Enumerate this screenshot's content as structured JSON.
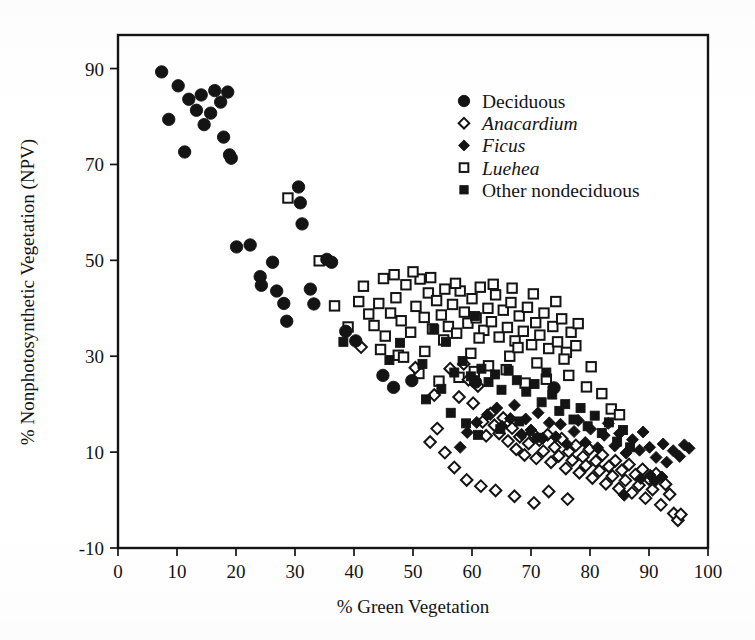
{
  "figure": {
    "kind": "scatter-plot",
    "background_color": "#ffffff",
    "ink_color": "#141414"
  },
  "axes": {
    "x": {
      "title": "% Green Vegetation",
      "min": 0,
      "max": 100,
      "ticks": [
        0,
        10,
        20,
        30,
        40,
        50,
        60,
        70,
        80,
        90,
        100
      ],
      "tick_labels": [
        "0",
        "10",
        "20",
        "30",
        "40",
        "50",
        "60",
        "70",
        "80",
        "90",
        "100"
      ]
    },
    "y": {
      "title": "% Nonphotosynthetic Vegetation (NPV)",
      "min": -10,
      "max": 97,
      "ticks": [
        -10,
        10,
        30,
        50,
        70,
        90
      ],
      "tick_labels": [
        "-10",
        "10",
        "30",
        "50",
        "70",
        "90"
      ]
    }
  },
  "legend": {
    "position": "top-right",
    "entries": [
      {
        "label": "Deciduous",
        "marker": "filled-circle",
        "italic": false
      },
      {
        "label": "Anacardium",
        "marker": "open-diamond",
        "italic": true
      },
      {
        "label": "Ficus",
        "marker": "filled-diamond",
        "italic": true
      },
      {
        "label": "Luehea",
        "marker": "open-square",
        "italic": true
      },
      {
        "label": "Other nondeciduous",
        "marker": "filled-square",
        "italic": false
      }
    ]
  },
  "chart_data": {
    "type": "scatter",
    "title": "",
    "xlabel": "% Green Vegetation",
    "ylabel": "% Nonphotosynthetic Vegetation (NPV)",
    "xlim": [
      0,
      100
    ],
    "ylim": [
      -10,
      97
    ],
    "grid": false,
    "legend_position": "top-right",
    "series": [
      {
        "name": "Deciduous",
        "marker": "filled-circle",
        "points": [
          [
            7.4,
            89.3
          ],
          [
            8.6,
            79.4
          ],
          [
            10.2,
            86.4
          ],
          [
            11.3,
            72.6
          ],
          [
            12.0,
            83.6
          ],
          [
            13.3,
            81.3
          ],
          [
            14.1,
            84.5
          ],
          [
            14.6,
            78.3
          ],
          [
            15.7,
            80.7
          ],
          [
            16.4,
            85.4
          ],
          [
            17.4,
            83.0
          ],
          [
            17.9,
            75.7
          ],
          [
            18.6,
            85.1
          ],
          [
            18.9,
            72.0
          ],
          [
            19.2,
            71.3
          ],
          [
            20.1,
            52.8
          ],
          [
            22.4,
            53.2
          ],
          [
            24.1,
            46.6
          ],
          [
            24.3,
            44.8
          ],
          [
            26.2,
            49.6
          ],
          [
            26.9,
            43.6
          ],
          [
            28.1,
            41.0
          ],
          [
            28.6,
            37.3
          ],
          [
            30.6,
            65.3
          ],
          [
            30.9,
            62.0
          ],
          [
            31.2,
            57.6
          ],
          [
            32.6,
            44.0
          ],
          [
            33.2,
            40.9
          ],
          [
            35.4,
            50.2
          ],
          [
            36.2,
            49.6
          ],
          [
            38.6,
            35.2
          ],
          [
            40.3,
            33.2
          ],
          [
            44.9,
            26.0
          ],
          [
            46.7,
            23.5
          ],
          [
            49.8,
            24.9
          ],
          [
            60.6,
            24.6
          ],
          [
            73.9,
            23.4
          ]
        ]
      },
      {
        "name": "Anacardium",
        "marker": "open-diamond",
        "points": [
          [
            41.2,
            31.9
          ],
          [
            50.4,
            27.6
          ],
          [
            53.6,
            21.9
          ],
          [
            54.1,
            14.9
          ],
          [
            56.3,
            27.4
          ],
          [
            57.8,
            21.5
          ],
          [
            58.6,
            28.4
          ],
          [
            59.4,
            25.1
          ],
          [
            60.2,
            20.2
          ],
          [
            61.0,
            23.8
          ],
          [
            61.8,
            16.3
          ],
          [
            62.4,
            13.4
          ],
          [
            63.1,
            18.0
          ],
          [
            63.8,
            15.6
          ],
          [
            64.6,
            13.9
          ],
          [
            65.3,
            17.1
          ],
          [
            66.1,
            12.3
          ],
          [
            66.8,
            15.0
          ],
          [
            67.5,
            10.6
          ],
          [
            68.1,
            13.2
          ],
          [
            68.9,
            9.4
          ],
          [
            69.6,
            11.8
          ],
          [
            70.2,
            14.0
          ],
          [
            70.9,
            8.7
          ],
          [
            71.4,
            12.5
          ],
          [
            72.1,
            10.2
          ],
          [
            72.8,
            13.6
          ],
          [
            73.4,
            7.9
          ],
          [
            74.0,
            11.0
          ],
          [
            74.7,
            9.2
          ],
          [
            75.2,
            12.8
          ],
          [
            75.9,
            6.6
          ],
          [
            76.4,
            10.1
          ],
          [
            77.0,
            8.3
          ],
          [
            77.6,
            11.4
          ],
          [
            78.2,
            5.7
          ],
          [
            78.8,
            9.0
          ],
          [
            79.3,
            7.2
          ],
          [
            79.9,
            10.6
          ],
          [
            80.4,
            4.6
          ],
          [
            81.0,
            8.1
          ],
          [
            81.6,
            6.1
          ],
          [
            82.1,
            9.4
          ],
          [
            82.7,
            3.4
          ],
          [
            83.2,
            7.0
          ],
          [
            83.8,
            5.0
          ],
          [
            84.3,
            8.2
          ],
          [
            84.9,
            2.4
          ],
          [
            85.4,
            6.2
          ],
          [
            86.0,
            4.1
          ],
          [
            86.6,
            7.4
          ],
          [
            87.1,
            1.5
          ],
          [
            87.7,
            5.3
          ],
          [
            88.3,
            3.1
          ],
          [
            88.9,
            6.4
          ],
          [
            89.4,
            0.4
          ],
          [
            90.0,
            4.4
          ],
          [
            90.6,
            2.2
          ],
          [
            91.2,
            5.5
          ],
          [
            92.0,
            -1.0
          ],
          [
            92.8,
            3.3
          ],
          [
            93.5,
            1.2
          ],
          [
            94.2,
            -2.8
          ],
          [
            94.9,
            -4.2
          ],
          [
            95.4,
            -3.0
          ],
          [
            64.0,
            2.0
          ],
          [
            67.2,
            0.8
          ],
          [
            70.5,
            -0.6
          ],
          [
            73.0,
            1.8
          ],
          [
            76.2,
            0.2
          ],
          [
            57.0,
            6.8
          ],
          [
            59.1,
            4.2
          ],
          [
            61.5,
            2.9
          ],
          [
            55.4,
            9.9
          ],
          [
            52.9,
            12.1
          ]
        ]
      },
      {
        "name": "Ficus",
        "marker": "filled-diamond",
        "points": [
          [
            62.6,
            17.8
          ],
          [
            64.2,
            19.2
          ],
          [
            65.1,
            15.4
          ],
          [
            66.5,
            17.0
          ],
          [
            67.2,
            19.8
          ],
          [
            68.4,
            13.7
          ],
          [
            69.1,
            16.9
          ],
          [
            70.0,
            14.6
          ],
          [
            71.2,
            18.2
          ],
          [
            72.0,
            12.9
          ],
          [
            73.1,
            16.1
          ],
          [
            74.2,
            13.2
          ],
          [
            75.0,
            15.8
          ],
          [
            76.1,
            11.6
          ],
          [
            77.3,
            14.3
          ],
          [
            78.0,
            16.6
          ],
          [
            79.2,
            12.0
          ],
          [
            80.1,
            14.8
          ],
          [
            81.3,
            10.9
          ],
          [
            82.4,
            13.5
          ],
          [
            83.1,
            16.0
          ],
          [
            84.2,
            11.3
          ],
          [
            85.0,
            13.9
          ],
          [
            86.1,
            9.8
          ],
          [
            87.2,
            12.6
          ],
          [
            88.4,
            10.4
          ],
          [
            89.0,
            14.2
          ],
          [
            90.1,
            11.0
          ],
          [
            91.2,
            8.9
          ],
          [
            92.4,
            11.7
          ],
          [
            93.0,
            7.9
          ],
          [
            94.1,
            10.3
          ],
          [
            95.2,
            9.1
          ],
          [
            96.0,
            11.5
          ],
          [
            96.8,
            10.8
          ],
          [
            88.6,
            4.5
          ],
          [
            90.2,
            5.2
          ],
          [
            91.0,
            3.9
          ],
          [
            92.2,
            4.8
          ],
          [
            85.8,
            1.0
          ],
          [
            60.8,
            16.2
          ],
          [
            59.2,
            14.1
          ],
          [
            58.0,
            11.0
          ]
        ]
      },
      {
        "name": "Luehea",
        "marker": "open-square",
        "points": [
          [
            28.8,
            63.0
          ],
          [
            34.1,
            49.9
          ],
          [
            36.7,
            40.5
          ],
          [
            39.0,
            36.1
          ],
          [
            40.8,
            41.4
          ],
          [
            41.6,
            44.6
          ],
          [
            42.5,
            38.8
          ],
          [
            43.4,
            36.4
          ],
          [
            44.2,
            41.0
          ],
          [
            45.3,
            34.2
          ],
          [
            46.2,
            39.0
          ],
          [
            47.1,
            42.2
          ],
          [
            48.0,
            37.4
          ],
          [
            48.8,
            44.9
          ],
          [
            49.6,
            35.0
          ],
          [
            50.5,
            40.4
          ],
          [
            51.2,
            46.1
          ],
          [
            51.9,
            38.1
          ],
          [
            52.6,
            43.2
          ],
          [
            53.3,
            35.7
          ],
          [
            54.0,
            41.6
          ],
          [
            54.8,
            38.6
          ],
          [
            55.4,
            44.0
          ],
          [
            56.0,
            36.2
          ],
          [
            56.7,
            40.8
          ],
          [
            57.4,
            34.8
          ],
          [
            58.0,
            43.6
          ],
          [
            58.7,
            39.2
          ],
          [
            59.3,
            36.9
          ],
          [
            60.0,
            42.0
          ],
          [
            60.7,
            38.0
          ],
          [
            61.4,
            44.4
          ],
          [
            62.0,
            35.4
          ],
          [
            62.7,
            40.0
          ],
          [
            63.3,
            37.2
          ],
          [
            64.0,
            42.8
          ],
          [
            64.6,
            34.0
          ],
          [
            65.3,
            39.6
          ],
          [
            66.0,
            36.0
          ],
          [
            66.6,
            41.2
          ],
          [
            67.3,
            33.2
          ],
          [
            68.0,
            38.4
          ],
          [
            68.7,
            35.2
          ],
          [
            69.4,
            40.2
          ],
          [
            70.1,
            32.4
          ],
          [
            70.8,
            37.0
          ],
          [
            71.5,
            34.4
          ],
          [
            72.2,
            39.0
          ],
          [
            73.0,
            31.6
          ],
          [
            73.7,
            36.2
          ],
          [
            74.5,
            33.0
          ],
          [
            75.2,
            37.8
          ],
          [
            76.0,
            30.8
          ],
          [
            76.8,
            35.0
          ],
          [
            77.6,
            32.2
          ],
          [
            45.0,
            46.2
          ],
          [
            46.8,
            47.0
          ],
          [
            50.0,
            47.6
          ],
          [
            53.0,
            46.4
          ],
          [
            57.2,
            45.2
          ],
          [
            63.6,
            45.0
          ],
          [
            66.8,
            44.2
          ],
          [
            70.4,
            43.0
          ],
          [
            74.2,
            41.4
          ],
          [
            78.0,
            36.8
          ],
          [
            44.5,
            31.4
          ],
          [
            47.5,
            30.2
          ],
          [
            52.0,
            31.0
          ],
          [
            55.2,
            33.4
          ],
          [
            48.4,
            29.8
          ],
          [
            57.8,
            25.6
          ],
          [
            60.4,
            26.8
          ],
          [
            62.8,
            28.0
          ],
          [
            65.8,
            27.2
          ],
          [
            69.0,
            24.4
          ],
          [
            72.6,
            25.2
          ],
          [
            76.4,
            26.0
          ],
          [
            79.4,
            23.6
          ],
          [
            82.0,
            22.2
          ],
          [
            83.6,
            19.0
          ],
          [
            51.0,
            26.4
          ],
          [
            54.4,
            24.8
          ],
          [
            59.8,
            30.6
          ],
          [
            66.4,
            30.0
          ],
          [
            71.0,
            28.6
          ],
          [
            61.2,
            33.8
          ],
          [
            67.8,
            31.8
          ],
          [
            75.6,
            29.4
          ],
          [
            80.2,
            27.8
          ],
          [
            85.0,
            17.8
          ]
        ]
      },
      {
        "name": "Other nondeciduous",
        "marker": "filled-square",
        "points": [
          [
            38.2,
            33.0
          ],
          [
            46.0,
            29.2
          ],
          [
            47.8,
            32.8
          ],
          [
            51.6,
            28.4
          ],
          [
            53.6,
            35.6
          ],
          [
            54.8,
            23.2
          ],
          [
            55.6,
            33.0
          ],
          [
            57.0,
            26.6
          ],
          [
            58.4,
            29.0
          ],
          [
            59.8,
            25.8
          ],
          [
            60.5,
            38.4
          ],
          [
            61.6,
            27.4
          ],
          [
            62.8,
            24.6
          ],
          [
            63.9,
            26.2
          ],
          [
            65.0,
            23.0
          ],
          [
            66.2,
            27.0
          ],
          [
            67.6,
            25.0
          ],
          [
            69.2,
            22.6
          ],
          [
            70.6,
            24.2
          ],
          [
            71.8,
            20.4
          ],
          [
            72.6,
            26.6
          ],
          [
            73.6,
            22.0
          ],
          [
            74.8,
            18.6
          ],
          [
            75.8,
            20.0
          ],
          [
            77.2,
            16.8
          ],
          [
            78.4,
            19.2
          ],
          [
            79.6,
            15.4
          ],
          [
            80.8,
            17.6
          ],
          [
            82.0,
            14.0
          ],
          [
            83.2,
            16.2
          ],
          [
            84.6,
            12.2
          ],
          [
            85.6,
            14.6
          ],
          [
            86.8,
            11.0
          ],
          [
            64.8,
            14.8
          ],
          [
            68.0,
            16.4
          ],
          [
            71.0,
            13.0
          ],
          [
            56.4,
            18.2
          ],
          [
            59.0,
            16.0
          ],
          [
            61.0,
            13.6
          ],
          [
            52.2,
            21.0
          ]
        ]
      }
    ]
  }
}
